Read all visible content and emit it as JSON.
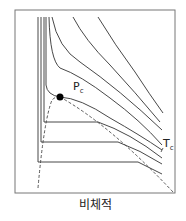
{
  "diagram": {
    "type": "P-v isotherm diagram",
    "xlabel": "비체적",
    "critical_point_label": "P",
    "critical_point_sub": "c",
    "critical_temp_label": "T",
    "critical_temp_sub": "c",
    "colors": {
      "line": "#333333",
      "frame": "#555555",
      "point": "#000000"
    }
  }
}
